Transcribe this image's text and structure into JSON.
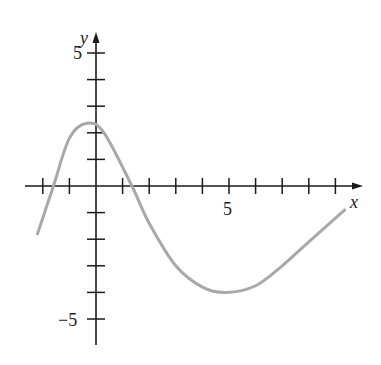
{
  "chart_data": {
    "type": "line",
    "title": "",
    "xlabel": "x",
    "ylabel": "y",
    "x_tick_labels": [
      {
        "value": 5,
        "label": "5"
      }
    ],
    "y_tick_labels": [
      {
        "value": 5,
        "label": "5"
      },
      {
        "value": -5,
        "label": "−5"
      }
    ],
    "xlim": [
      -2.6,
      10
    ],
    "ylim": [
      -6,
      5.9
    ],
    "x_ticks": [
      -2,
      -1,
      1,
      2,
      3,
      4,
      5,
      6,
      7,
      8,
      9
    ],
    "y_ticks": [
      -5,
      -4,
      -3,
      -2,
      -1,
      1,
      2,
      3,
      4,
      5
    ],
    "grid": false,
    "legend": null,
    "series": [
      {
        "name": "f(x)",
        "color": "#a8a8a8",
        "x": [
          -2.2,
          -1.6,
          -1.0,
          -0.35,
          0.3,
          1.35,
          2.0,
          3.0,
          4.0,
          4.9,
          6.0,
          7.0,
          8.0,
          9.35
        ],
        "y": [
          -1.8,
          0.0,
          1.8,
          2.36,
          2.0,
          0.0,
          -1.4,
          -3.0,
          -3.8,
          -4.0,
          -3.75,
          -3.0,
          -2.1,
          -0.9
        ]
      }
    ]
  },
  "axes": {
    "x_label": "x",
    "y_label": "y",
    "x_tick_5": "5",
    "y_tick_5": "5",
    "y_tick_neg5": "−5"
  }
}
